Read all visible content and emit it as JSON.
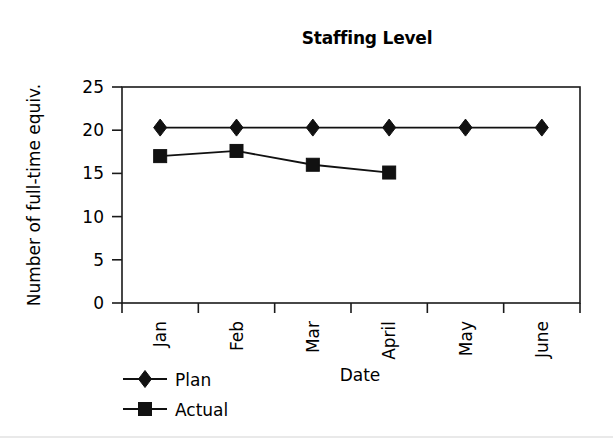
{
  "chart_data": {
    "type": "line",
    "title": "Staffing Level",
    "xlabel": "Date",
    "ylabel": "Number of full-time equiv.",
    "categories": [
      "Jan",
      "Feb",
      "Mar",
      "April",
      "May",
      "June"
    ],
    "series": [
      {
        "name": "Plan",
        "marker": "diamond",
        "values": [
          20.3,
          20.3,
          20.3,
          20.3,
          20.3,
          20.3
        ]
      },
      {
        "name": "Actual",
        "marker": "square",
        "values": [
          17.0,
          17.6,
          16.0,
          15.1,
          null,
          null
        ]
      }
    ],
    "ylim": [
      0,
      25
    ],
    "yticks": [
      0,
      5,
      10,
      15,
      20,
      25
    ],
    "ytick_labels": [
      "0",
      "5",
      "10",
      "15",
      "20",
      "25"
    ],
    "grid": false,
    "legend_position": "bottom-left",
    "xtick_label_rotation": -90,
    "colors": {
      "plan": "#111111",
      "actual": "#111111",
      "axis": "#1a1a1a",
      "background": "#ffffff"
    }
  },
  "legend": {
    "items": [
      {
        "label": "Plan",
        "marker": "diamond-icon"
      },
      {
        "label": "Actual",
        "marker": "square-icon"
      }
    ]
  }
}
